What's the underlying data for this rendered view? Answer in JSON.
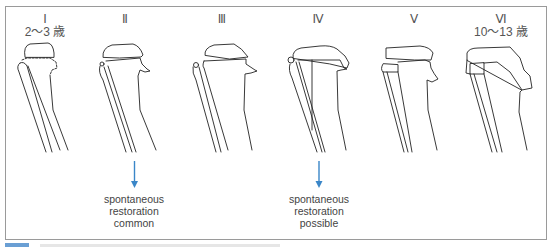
{
  "figure": {
    "stages": [
      {
        "numeral": "Ⅰ",
        "age": "2～3 歳"
      },
      {
        "numeral": "Ⅱ",
        "age": ""
      },
      {
        "numeral": "Ⅲ",
        "age": ""
      },
      {
        "numeral": "Ⅳ",
        "age": ""
      },
      {
        "numeral": "Ⅴ",
        "age": ""
      },
      {
        "numeral": "Ⅵ",
        "age": "10～13 歳"
      }
    ],
    "annotations": [
      {
        "stage": "Ⅱ",
        "icon": "arrow-down-icon",
        "lines": [
          "spontaneous",
          "restoration",
          "common"
        ]
      },
      {
        "stage": "Ⅳ",
        "icon": "arrow-down-icon",
        "lines": [
          "spontaneous",
          "restoration",
          "possible"
        ]
      }
    ],
    "colors": {
      "arrow": "#3a86c8",
      "line": "#222222",
      "border": "#9a9a9a",
      "caption_accent": "#6a9fd4"
    }
  }
}
